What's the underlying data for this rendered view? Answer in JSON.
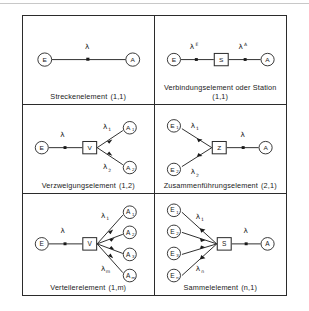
{
  "figure": {
    "grid": {
      "columns": 2,
      "rows": 3
    },
    "cells": [
      {
        "id": "streckenelement",
        "caption": "Streckenelement",
        "code": "(1,1)",
        "caption_line2": "",
        "inputs": [
          {
            "label": "E",
            "sub": ""
          }
        ],
        "outputs": [
          {
            "label": "A",
            "sub": ""
          }
        ],
        "center_node": "",
        "rates": [
          {
            "base": "λ",
            "sub": "",
            "sup": ""
          }
        ]
      },
      {
        "id": "verbindungselement",
        "caption": "Verbindungselement oder Station",
        "code": "",
        "caption_line2": "(1,1)",
        "inputs": [
          {
            "label": "E",
            "sub": ""
          }
        ],
        "outputs": [
          {
            "label": "A",
            "sub": ""
          }
        ],
        "center_node": "S",
        "rates": [
          {
            "base": "λ",
            "sub": "",
            "sup": "E"
          },
          {
            "base": "λ",
            "sub": "",
            "sup": "A"
          }
        ]
      },
      {
        "id": "verzweigungselement",
        "caption": "Verzweigungselement",
        "code": "(1,2)",
        "caption_line2": "",
        "inputs": [
          {
            "label": "E",
            "sub": ""
          }
        ],
        "outputs": [
          {
            "label": "A",
            "sub": "1"
          },
          {
            "label": "A",
            "sub": "2"
          }
        ],
        "center_node": "V",
        "rates": [
          {
            "base": "λ",
            "sub": "",
            "sup": ""
          },
          {
            "base": "λ",
            "sub": "1",
            "sup": ""
          },
          {
            "base": "λ",
            "sub": "2",
            "sup": ""
          }
        ]
      },
      {
        "id": "zusammenfuehrungselement",
        "caption": "Zusammenführungselement",
        "code": "(2,1)",
        "caption_line2": "",
        "inputs": [
          {
            "label": "E",
            "sub": "1"
          },
          {
            "label": "E",
            "sub": "2"
          }
        ],
        "outputs": [
          {
            "label": "A",
            "sub": ""
          }
        ],
        "center_node": "Z",
        "rates": [
          {
            "base": "λ",
            "sub": "1",
            "sup": ""
          },
          {
            "base": "λ",
            "sub": "2",
            "sup": ""
          },
          {
            "base": "λ",
            "sub": "",
            "sup": ""
          }
        ]
      },
      {
        "id": "verteilerelement",
        "caption": "Verteilerelement",
        "code": "(1,m)",
        "caption_line2": "",
        "inputs": [
          {
            "label": "E",
            "sub": ""
          }
        ],
        "outputs": [
          {
            "label": "A",
            "sub": "1"
          },
          {
            "label": "A",
            "sub": "2"
          },
          {
            "label": "A",
            "sub": "3"
          },
          {
            "label": "A",
            "sub": "m"
          }
        ],
        "center_node": "V",
        "rates": [
          {
            "base": "λ",
            "sub": "",
            "sup": ""
          },
          {
            "base": "λ",
            "sub": "1",
            "sup": ""
          },
          {
            "base": "λ",
            "sub": "m",
            "sup": ""
          }
        ]
      },
      {
        "id": "sammelelement",
        "caption": "Sammelelement",
        "code": "(n,1)",
        "caption_line2": "",
        "inputs": [
          {
            "label": "E",
            "sub": "1"
          },
          {
            "label": "E",
            "sub": "2"
          },
          {
            "label": "E",
            "sub": "3"
          },
          {
            "label": "E",
            "sub": "n"
          }
        ],
        "outputs": [
          {
            "label": "A",
            "sub": ""
          }
        ],
        "center_node": "S",
        "rates": [
          {
            "base": "λ",
            "sub": "1",
            "sup": ""
          },
          {
            "base": "λ",
            "sub": "n",
            "sup": ""
          },
          {
            "base": "λ",
            "sub": "",
            "sup": ""
          }
        ]
      }
    ]
  },
  "colors": {
    "ink": "#2b2b2b",
    "background": "#ffffff"
  }
}
